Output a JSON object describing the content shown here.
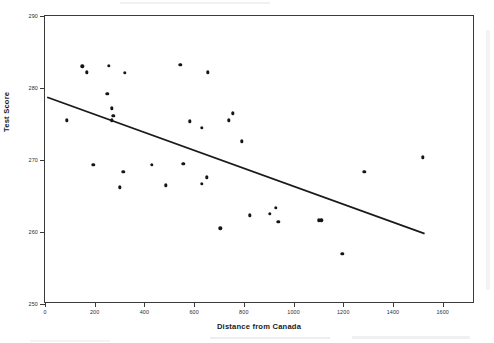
{
  "figure": {
    "title": "",
    "x_axis_title": "Distance from Canada",
    "y_axis_title": "Test Score"
  },
  "chart_data": {
    "type": "scatter",
    "title": "",
    "xlabel": "Distance from Canada",
    "ylabel": "Test Score",
    "xlim": [
      0,
      1730
    ],
    "ylim": [
      250,
      290
    ],
    "xticks": [
      0,
      200,
      400,
      600,
      800,
      1000,
      1200,
      1400,
      1600
    ],
    "xtick_labels": [
      "0",
      "200",
      "400",
      "600",
      "800",
      "1000",
      "1200",
      "1400",
      "1600"
    ],
    "yticks": [
      250,
      260,
      270,
      280,
      290
    ],
    "ytick_labels": [
      "250",
      "260",
      "270",
      "280",
      "290"
    ],
    "grid": false,
    "legend": false,
    "marker": "filled-circle",
    "marker_color": "#151515",
    "line_color": "#1a1a1a",
    "points": [
      {
        "x": 150,
        "y": 283.0
      },
      {
        "x": 168,
        "y": 282.2
      },
      {
        "x": 257,
        "y": 283.1
      },
      {
        "x": 322,
        "y": 282.1
      },
      {
        "x": 250,
        "y": 279.2
      },
      {
        "x": 269,
        "y": 277.2
      },
      {
        "x": 275,
        "y": 276.1
      },
      {
        "x": 268,
        "y": 275.5
      },
      {
        "x": 87,
        "y": 275.5
      },
      {
        "x": 544,
        "y": 283.2
      },
      {
        "x": 654,
        "y": 282.2
      },
      {
        "x": 583,
        "y": 275.4
      },
      {
        "x": 632,
        "y": 274.5
      },
      {
        "x": 740,
        "y": 275.5
      },
      {
        "x": 755,
        "y": 276.5
      },
      {
        "x": 793,
        "y": 272.6
      },
      {
        "x": 194,
        "y": 269.3
      },
      {
        "x": 315,
        "y": 268.4
      },
      {
        "x": 430,
        "y": 269.3
      },
      {
        "x": 557,
        "y": 269.5
      },
      {
        "x": 487,
        "y": 266.5
      },
      {
        "x": 632,
        "y": 266.7
      },
      {
        "x": 650,
        "y": 267.6
      },
      {
        "x": 300,
        "y": 266.2
      },
      {
        "x": 705,
        "y": 260.5
      },
      {
        "x": 1521,
        "y": 270.4
      },
      {
        "x": 1284,
        "y": 268.4
      },
      {
        "x": 929,
        "y": 263.4
      },
      {
        "x": 904,
        "y": 262.5
      },
      {
        "x": 825,
        "y": 262.3
      },
      {
        "x": 939,
        "y": 261.4
      },
      {
        "x": 1102,
        "y": 261.6
      },
      {
        "x": 1112,
        "y": 261.6
      },
      {
        "x": 1196,
        "y": 257.0
      }
    ],
    "trendline": {
      "type": "linear-fit",
      "x_start": 12,
      "y_start": 278.6,
      "x_end": 1531,
      "y_end": 259.6
    }
  }
}
